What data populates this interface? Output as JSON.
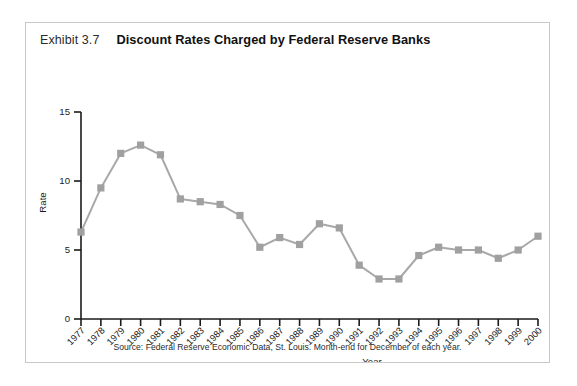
{
  "figure": {
    "exhibit_label": "Exhibit 3.7",
    "title": "Discount Rates Charged by Federal Reserve Banks",
    "source_note": "Source: Federal Reserve Economic Data, St. Louis. Month-end for December of each year.",
    "frame_color": "#c9c9c9"
  },
  "chart_data": {
    "type": "line",
    "title": "Discount Rates Charged by Federal Reserve Banks",
    "subtitle": "Exhibit 3.7",
    "xlabel": "Year",
    "ylabel": "Rate",
    "x": [
      1977,
      1978,
      1979,
      1980,
      1981,
      1982,
      1983,
      1984,
      1985,
      1986,
      1987,
      1988,
      1989,
      1990,
      1991,
      1992,
      1993,
      1994,
      1995,
      1996,
      1997,
      1998,
      1999,
      2000
    ],
    "categories": [
      "1977",
      "1978",
      "1979",
      "1980",
      "1981",
      "1982",
      "1983",
      "1984",
      "1985",
      "1986",
      "1987",
      "1988",
      "1989",
      "1990",
      "1991",
      "1992",
      "1993",
      "1994",
      "1995",
      "1996",
      "1997",
      "1998",
      "1999",
      "2000"
    ],
    "values": [
      6.3,
      9.5,
      12.0,
      12.6,
      11.9,
      8.7,
      8.5,
      8.3,
      7.5,
      5.2,
      5.9,
      5.4,
      6.9,
      6.6,
      3.9,
      2.9,
      2.9,
      4.6,
      5.2,
      5.0,
      5.0,
      4.4,
      5.0,
      6.0
    ],
    "series": [
      {
        "name": "Discount Rate",
        "values": [
          6.3,
          9.5,
          12.0,
          12.6,
          11.9,
          8.7,
          8.5,
          8.3,
          7.5,
          5.2,
          5.9,
          5.4,
          6.9,
          6.6,
          3.9,
          2.9,
          2.9,
          4.6,
          5.2,
          5.0,
          5.0,
          4.4,
          5.0,
          6.0
        ],
        "color": "#a8a8a8",
        "marker": "square"
      }
    ],
    "ylim": [
      0,
      15
    ],
    "yticks": [
      0,
      5,
      10,
      15
    ],
    "ytick_labels": [
      "0",
      "5",
      "10",
      "15"
    ],
    "xlim": [
      1977,
      2000
    ],
    "grid": false,
    "legend": null,
    "line_color": "#a8a8a8",
    "marker_color": "#a0a0a0",
    "axis_color": "#1b1b1b"
  }
}
